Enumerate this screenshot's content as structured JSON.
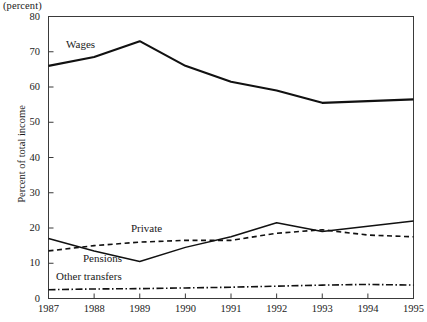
{
  "figure": {
    "unit_caption": "(percent)",
    "yaxis_title": "Percent of total income"
  },
  "chart_data": {
    "type": "line",
    "title": "",
    "subtitle": "",
    "unit_caption": "(percent)",
    "xlabel": "",
    "ylabel": "Percent of total income",
    "categories": [
      "1987",
      "1988",
      "1989",
      "1990",
      "1991",
      "1992",
      "1993",
      "1994",
      "1995"
    ],
    "x": [
      1987,
      1988,
      1989,
      1990,
      1991,
      1992,
      1993,
      1994,
      1995
    ],
    "xlim": [
      1987,
      1995
    ],
    "ylim": [
      0,
      80
    ],
    "yticks": [
      0,
      10,
      20,
      30,
      40,
      50,
      60,
      70,
      80
    ],
    "xticks": [
      1987,
      1988,
      1989,
      1990,
      1991,
      1992,
      1993,
      1994,
      1995
    ],
    "grid": false,
    "legend_position": "inline-annotations",
    "series": [
      {
        "name": "Wages",
        "style": "solid-thick",
        "color": "#111111",
        "values": [
          66.0,
          68.5,
          73.0,
          66.0,
          61.5,
          59.0,
          55.5,
          56.0,
          56.5
        ]
      },
      {
        "name": "Pensions",
        "style": "solid-thin",
        "color": "#111111",
        "values": [
          17.0,
          13.5,
          10.5,
          14.5,
          17.5,
          21.5,
          19.0,
          20.5,
          22.0
        ]
      },
      {
        "name": "Private",
        "style": "dashed",
        "color": "#111111",
        "values": [
          13.5,
          15.0,
          16.0,
          16.5,
          16.5,
          18.5,
          19.5,
          18.0,
          17.5
        ]
      },
      {
        "name": "Other transfers",
        "style": "dash-dot",
        "color": "#111111",
        "values": [
          2.5,
          2.7,
          2.8,
          3.0,
          3.2,
          3.5,
          3.8,
          4.0,
          3.8
        ]
      }
    ],
    "annotations": [
      {
        "text": "Wages",
        "series": "Wages"
      },
      {
        "text": "Private",
        "series": "Private"
      },
      {
        "text": "Pensions",
        "series": "Pensions"
      },
      {
        "text": "Other transfers",
        "series": "Other transfers"
      }
    ]
  },
  "axes": {
    "y_tick_labels": [
      "80",
      "70",
      "60",
      "50",
      "40",
      "30",
      "20",
      "10",
      "0"
    ],
    "x_tick_labels": [
      "1987",
      "1988",
      "1989",
      "1990",
      "1991",
      "1992",
      "1993",
      "1994",
      "1995"
    ]
  },
  "annotations": {
    "wages": "Wages",
    "private": "Private",
    "pensions": "Pensions",
    "other_transfers": "Other transfers"
  }
}
